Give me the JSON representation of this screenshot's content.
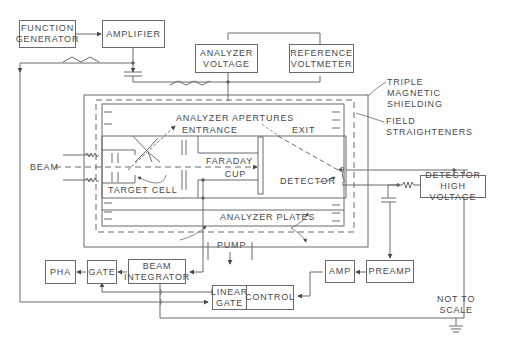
{
  "diagram": {
    "type": "schematic",
    "blocks": {
      "function_generator": [
        "FUNCTION",
        "GENERATOR"
      ],
      "amplifier": "AMPLIFIER",
      "analyzer_voltage": [
        "ANALYZER",
        "VOLTAGE"
      ],
      "reference_voltmeter": [
        "REFERENCE",
        "VOLTMETER"
      ],
      "detector_high_voltage": [
        "DETECTOR",
        "HIGH VOLTAGE"
      ],
      "pha": "PHA",
      "gate": "GATE",
      "beam_integrator": [
        "BEAM",
        "INTEGRATOR"
      ],
      "linear_gate": [
        "LINEAR",
        "GATE"
      ],
      "control": "CONTROL",
      "amp": "AMP",
      "preamp": "PREAMP"
    },
    "labels": {
      "triple_shielding": [
        "TRIPLE",
        "MAGNETIC",
        "SHIELDING"
      ],
      "field_straighteners": [
        "FIELD",
        "STRAIGHTENERS"
      ],
      "analyzer_apertures": "ANALYZER APERTURES",
      "entrance": "ENTRANCE",
      "exit": "EXIT",
      "beam": "BEAM",
      "target_cell": "TARGET CELL",
      "faraday_cup": [
        "FARADAY",
        "CUP"
      ],
      "detector": "DETECTOR",
      "analyzer_plates": "ANALYZER PLATES",
      "pump": "PUMP",
      "not_to_scale": [
        "NOT TO",
        "SCALE"
      ]
    },
    "colors": {
      "line": "#6a6a6a",
      "text": "#4a4a4a",
      "background": "#ffffff"
    }
  }
}
